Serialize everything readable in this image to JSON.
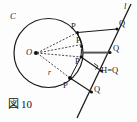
{
  "figure": {
    "caption_mark": "図",
    "caption_number": "10",
    "caption_full": "図 10",
    "type": "geometry-diagram"
  },
  "labels": {
    "circle_name": "C",
    "center": "O",
    "radius": "r",
    "line": "l",
    "point_p": "P",
    "point_q": "Q",
    "foot_point": "H=Q"
  },
  "geometry": {
    "circle": {
      "cx": 48.5,
      "cy": 53,
      "r": 34.5
    },
    "center_dot": {
      "x": 36,
      "y": 53
    },
    "line_l": {
      "x1": 130,
      "y1": 6,
      "x2": 78,
      "y2": 116
    },
    "p_points": [
      {
        "x": 77.5,
        "y": 32.5,
        "label": "P",
        "label_x": 72,
        "label_y": 24
      },
      {
        "x": 81.5,
        "y": 44.5,
        "label": "P",
        "label_x": 77,
        "label_y": 37
      },
      {
        "x": 81.0,
        "y": 57.0,
        "label": "P",
        "label_x": 76,
        "label_y": 61
      },
      {
        "x": 70.0,
        "y": 78.0,
        "label": "P",
        "label_x": 64,
        "label_y": 83
      }
    ],
    "q_points": [
      {
        "x": 117.0,
        "y": 29.0,
        "label": "Q",
        "label_x": 119,
        "label_y": 21
      },
      {
        "x": 110.0,
        "y": 53.0,
        "label": "Q",
        "label_x": 113,
        "label_y": 46
      },
      {
        "x": 101.5,
        "y": 71.0,
        "label": "H=Q",
        "label_x": 104,
        "label_y": 68
      },
      {
        "x": 91.5,
        "y": 92.0,
        "label": "Q",
        "label_x": 94,
        "label_y": 86
      }
    ],
    "colors": {
      "stroke": "#1a1a1a",
      "dashed": "#3a3a3a",
      "highlight": "#555555",
      "background": "#fdfdfd"
    }
  }
}
